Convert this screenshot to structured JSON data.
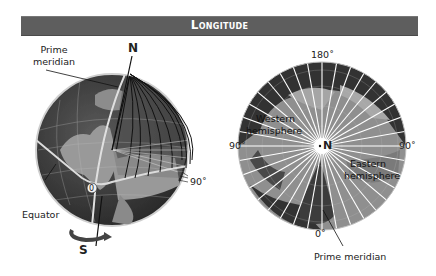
{
  "header": {
    "title": "Longitude"
  },
  "left_globe": {
    "labels": {
      "prime_meridian": "Prime\nmeridian",
      "prime_meridian_line1": "Prime",
      "prime_meridian_line2": "meridian",
      "north": "N",
      "south": "S",
      "equator": "Equator",
      "zero": "0",
      "ninety": "90˚"
    }
  },
  "right_map": {
    "labels": {
      "top": "180˚",
      "left": "90˚",
      "right": "90˚",
      "bottom": "0˚",
      "center": "N",
      "western_line1": "Western",
      "western_line2": "hemisphere",
      "eastern_line1": "Eastern",
      "eastern_line2": "hemisphere",
      "prime_meridian": "Prime meridian"
    }
  },
  "colors": {
    "header_bg": "#5e5e5e",
    "ocean_dark": "#3a3a3a",
    "land_light": "#9a9a9a",
    "grid_line": "#ffffff",
    "meridian_line": "#111111"
  }
}
